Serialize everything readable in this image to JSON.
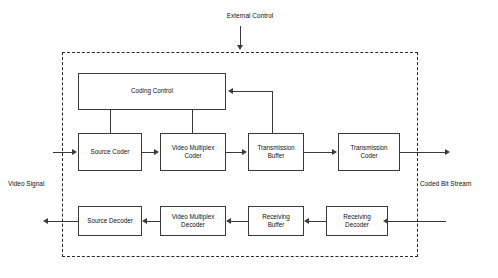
{
  "diagram": {
    "title_label": "External Control",
    "left_label": "Video Signal",
    "right_label": "Coded Bit Stream",
    "boxes": {
      "coding_control": "Coding Control",
      "source_coder": "Source Coder",
      "video_multiplex_coder": "Video Multiplex\nCoder",
      "transmission_buffer": "Transmission\nBuffer",
      "transmission_coder": "Transmission\nCoder",
      "source_decoder": "Source Decoder",
      "video_multiplex_decoder": "Video Multiplex\nDecoder",
      "receiving_buffer": "Receiving\nBuffer",
      "receiving_decoder": "Receiving\nDecoder"
    }
  }
}
